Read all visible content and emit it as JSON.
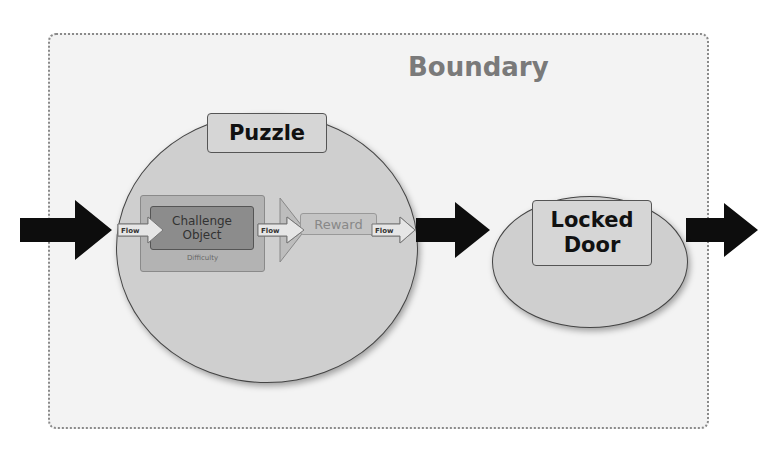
{
  "diagram": {
    "boundary": {
      "label": "Boundary"
    },
    "puzzle": {
      "label": "Puzzle",
      "challenge": {
        "label": "Challenge Object",
        "line1": "Challenge",
        "line2": "Object",
        "sublabel": "Difficulty"
      },
      "reward": {
        "label": "Reward"
      }
    },
    "locked_door": {
      "label": "Locked Door",
      "line1": "Locked",
      "line2": "Door"
    },
    "flows": [
      {
        "label": "Flow"
      },
      {
        "label": "Flow"
      },
      {
        "label": "Flow"
      }
    ],
    "arrows": [
      "entry",
      "puzzle-to-door",
      "exit"
    ]
  }
}
